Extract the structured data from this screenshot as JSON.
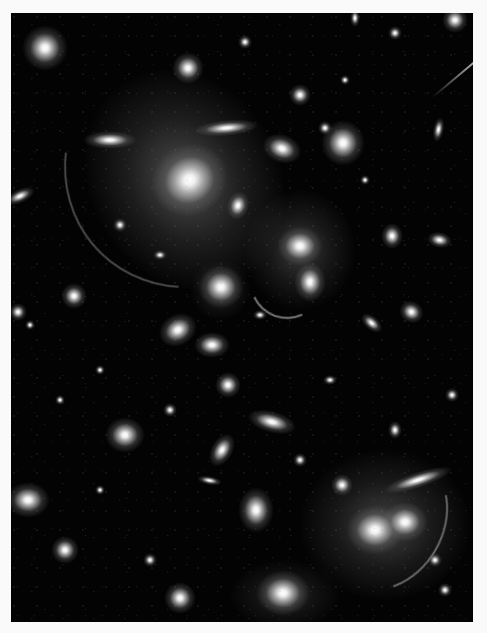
{
  "image": {
    "subject": "galaxy cluster with gravitational lensing arcs",
    "colorspace": "grayscale",
    "frame": {
      "left": 11,
      "top": 13,
      "width": 462,
      "height": 609,
      "background": "#030303",
      "border_color": "#fafafa"
    }
  },
  "halos": [
    {
      "x": 185,
      "y": 180,
      "w": 190,
      "h": 230,
      "rot": -30,
      "alpha": 0.38
    },
    {
      "x": 300,
      "y": 250,
      "w": 110,
      "h": 120,
      "rot": 0,
      "alpha": 0.28
    },
    {
      "x": 385,
      "y": 525,
      "w": 170,
      "h": 150,
      "rot": 0,
      "alpha": 0.32
    },
    {
      "x": 285,
      "y": 595,
      "w": 110,
      "h": 70,
      "rot": 0,
      "alpha": 0.2
    },
    {
      "x": 220,
      "y": 290,
      "w": 60,
      "h": 60,
      "rot": 0,
      "alpha": 0.2
    }
  ],
  "galaxies": [
    {
      "x": 190,
      "y": 180,
      "w": 44,
      "h": 40,
      "rot": -30
    },
    {
      "x": 45,
      "y": 48,
      "w": 26,
      "h": 26,
      "rot": 0
    },
    {
      "x": 188,
      "y": 68,
      "w": 18,
      "h": 18,
      "rot": 0
    },
    {
      "x": 110,
      "y": 140,
      "w": 30,
      "h": 10,
      "rot": 0
    },
    {
      "x": 226,
      "y": 128,
      "w": 36,
      "h": 9,
      "rot": -5
    },
    {
      "x": 238,
      "y": 205,
      "w": 12,
      "h": 16,
      "rot": 15
    },
    {
      "x": 282,
      "y": 148,
      "w": 22,
      "h": 16,
      "rot": 20
    },
    {
      "x": 343,
      "y": 143,
      "w": 24,
      "h": 26,
      "rot": 0
    },
    {
      "x": 300,
      "y": 246,
      "w": 26,
      "h": 22,
      "rot": 0
    },
    {
      "x": 310,
      "y": 282,
      "w": 18,
      "h": 22,
      "rot": 0
    },
    {
      "x": 221,
      "y": 287,
      "w": 26,
      "h": 24,
      "rot": 0
    },
    {
      "x": 178,
      "y": 330,
      "w": 22,
      "h": 18,
      "rot": -30
    },
    {
      "x": 212,
      "y": 345,
      "w": 20,
      "h": 14,
      "rot": 0
    },
    {
      "x": 300,
      "y": 95,
      "w": 12,
      "h": 12,
      "rot": 0
    },
    {
      "x": 392,
      "y": 236,
      "w": 12,
      "h": 14,
      "rot": 0
    },
    {
      "x": 440,
      "y": 240,
      "w": 14,
      "h": 9,
      "rot": 10
    },
    {
      "x": 74,
      "y": 296,
      "w": 14,
      "h": 14,
      "rot": 0
    },
    {
      "x": 18,
      "y": 312,
      "w": 10,
      "h": 10,
      "rot": 0
    },
    {
      "x": 20,
      "y": 196,
      "w": 18,
      "h": 8,
      "rot": -25
    },
    {
      "x": 372,
      "y": 323,
      "w": 14,
      "h": 8,
      "rot": 40
    },
    {
      "x": 412,
      "y": 312,
      "w": 14,
      "h": 12,
      "rot": 30
    },
    {
      "x": 438,
      "y": 130,
      "w": 6,
      "h": 14,
      "rot": 10
    },
    {
      "x": 125,
      "y": 435,
      "w": 22,
      "h": 20,
      "rot": 0
    },
    {
      "x": 228,
      "y": 385,
      "w": 14,
      "h": 14,
      "rot": 0
    },
    {
      "x": 272,
      "y": 422,
      "w": 28,
      "h": 12,
      "rot": 15
    },
    {
      "x": 222,
      "y": 450,
      "w": 12,
      "h": 20,
      "rot": 30
    },
    {
      "x": 256,
      "y": 510,
      "w": 20,
      "h": 26,
      "rot": 0
    },
    {
      "x": 28,
      "y": 500,
      "w": 24,
      "h": 20,
      "rot": 0
    },
    {
      "x": 65,
      "y": 550,
      "w": 16,
      "h": 16,
      "rot": 0
    },
    {
      "x": 180,
      "y": 598,
      "w": 18,
      "h": 18,
      "rot": 0
    },
    {
      "x": 283,
      "y": 593,
      "w": 30,
      "h": 26,
      "rot": 0
    },
    {
      "x": 375,
      "y": 530,
      "w": 32,
      "h": 28,
      "rot": 0
    },
    {
      "x": 405,
      "y": 522,
      "w": 26,
      "h": 22,
      "rot": 0
    },
    {
      "x": 342,
      "y": 485,
      "w": 12,
      "h": 12,
      "rot": 0
    },
    {
      "x": 418,
      "y": 480,
      "w": 40,
      "h": 9,
      "rot": -18
    },
    {
      "x": 395,
      "y": 430,
      "w": 8,
      "h": 10,
      "rot": 0
    },
    {
      "x": 452,
      "y": 395,
      "w": 8,
      "h": 8,
      "rot": 0
    },
    {
      "x": 435,
      "y": 560,
      "w": 8,
      "h": 8,
      "rot": 0
    },
    {
      "x": 30,
      "y": 325,
      "w": 6,
      "h": 6,
      "rot": 0
    },
    {
      "x": 120,
      "y": 225,
      "w": 8,
      "h": 8,
      "rot": 0
    },
    {
      "x": 160,
      "y": 255,
      "w": 8,
      "h": 6,
      "rot": 0
    },
    {
      "x": 325,
      "y": 128,
      "w": 8,
      "h": 8,
      "rot": 0
    },
    {
      "x": 365,
      "y": 180,
      "w": 6,
      "h": 6,
      "rot": 0
    },
    {
      "x": 245,
      "y": 42,
      "w": 8,
      "h": 8,
      "rot": 0
    },
    {
      "x": 395,
      "y": 33,
      "w": 8,
      "h": 8,
      "rot": 0
    },
    {
      "x": 355,
      "y": 18,
      "w": 6,
      "h": 10,
      "rot": 0
    },
    {
      "x": 100,
      "y": 370,
      "w": 6,
      "h": 6,
      "rot": 0
    },
    {
      "x": 60,
      "y": 400,
      "w": 6,
      "h": 6,
      "rot": 0
    },
    {
      "x": 170,
      "y": 410,
      "w": 8,
      "h": 8,
      "rot": 0
    },
    {
      "x": 330,
      "y": 380,
      "w": 8,
      "h": 6,
      "rot": 0
    },
    {
      "x": 300,
      "y": 460,
      "w": 8,
      "h": 8,
      "rot": 0
    },
    {
      "x": 150,
      "y": 560,
      "w": 8,
      "h": 8,
      "rot": 0
    },
    {
      "x": 100,
      "y": 490,
      "w": 6,
      "h": 6,
      "rot": 0
    },
    {
      "x": 445,
      "y": 590,
      "w": 8,
      "h": 8,
      "rot": 0
    },
    {
      "x": 210,
      "y": 480,
      "w": 14,
      "h": 5,
      "rot": 10
    },
    {
      "x": 345,
      "y": 80,
      "w": 6,
      "h": 6,
      "rot": 0
    },
    {
      "x": 260,
      "y": 315,
      "w": 8,
      "h": 6,
      "rot": 0
    },
    {
      "x": 455,
      "y": 20,
      "w": 14,
      "h": 14,
      "rot": 0
    }
  ],
  "arcs": [
    {
      "x": 60,
      "y": 30,
      "w": 270,
      "h": 250,
      "rot": -40,
      "side": "left",
      "alpha": 0.35
    },
    {
      "x": 250,
      "y": 245,
      "w": 70,
      "h": 70,
      "rot": 200,
      "side": "top",
      "alpha": 0.55
    },
    {
      "x": 330,
      "y": 450,
      "w": 110,
      "h": 140,
      "rot": 30,
      "side": "right",
      "alpha": 0.45
    }
  ],
  "spikes": [
    {
      "x": 418,
      "y": 58,
      "len": 60,
      "rot": -40
    }
  ]
}
